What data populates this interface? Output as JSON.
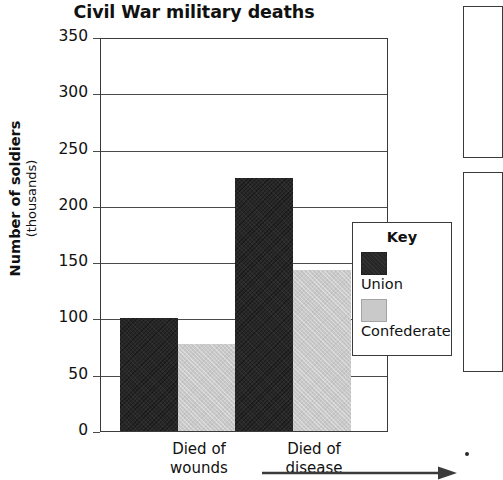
{
  "chart_data": {
    "type": "bar",
    "title": "Civil War military deaths",
    "xlabel": "",
    "ylabel": "Number of soldiers",
    "ylabel_sub": "(thousands)",
    "categories": [
      "Died of wounds",
      "Died of disease"
    ],
    "series": [
      {
        "name": "Union",
        "color": "#272727",
        "values": [
          100,
          225
        ]
      },
      {
        "name": "Confederate",
        "color": "#c9c9c9",
        "values": [
          77,
          143
        ]
      }
    ],
    "ylim": [
      0,
      350
    ],
    "ytick_step": 50,
    "yticks": [
      350,
      300,
      250,
      200,
      150,
      100,
      50,
      0
    ],
    "grid": true,
    "legend": {
      "title": "Key",
      "position": "inside-right",
      "entries": [
        {
          "label": "Union",
          "color": "#272727"
        },
        {
          "label": "Confederate",
          "color": "#c9c9c9"
        }
      ]
    },
    "annotations": [
      {
        "name": "x-axis-arrow",
        "type": "arrow",
        "direction": "right"
      }
    ]
  },
  "category_lines": [
    [
      "Died of",
      "wounds"
    ],
    [
      "Died of",
      "disease"
    ]
  ],
  "colors": {
    "union": "#272727",
    "confederate": "#c9c9c9",
    "axis": "#3a3a3a",
    "text": "#111111",
    "background": "#ffffff"
  }
}
